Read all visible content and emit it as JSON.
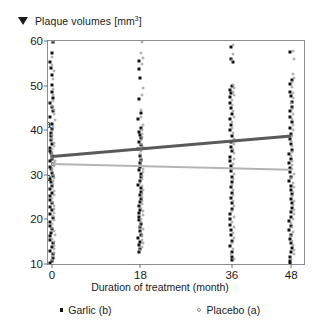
{
  "chart_data": {
    "type": "scatter",
    "title": "Plaque volumes [mm",
    "title_sup": "3",
    "title_suffix": "]",
    "xlabel": "Duration of treatment (month)",
    "ylabel": "Plaque volumes [mm3]",
    "xlim": [
      0,
      48
    ],
    "ylim": [
      10,
      60
    ],
    "grid": false,
    "xticks": [
      0,
      18,
      36,
      48
    ],
    "xtick_labels": [
      "0",
      "18",
      "36",
      "48"
    ],
    "xtick_positions_frac": [
      0.0155,
      0.361,
      0.718,
      0.95
    ],
    "yticks": [
      10,
      20,
      30,
      40,
      50,
      60
    ],
    "ytick_labels": [
      "10",
      "20",
      "30",
      "40",
      "50",
      "60"
    ],
    "legend_position": "below-axis",
    "series": [
      {
        "name": "Garlic (b)",
        "marker": "filled-square",
        "color": "#111111",
        "x_categories": [
          0,
          18,
          36,
          48
        ],
        "values_at_0": [
          59.8,
          57.2,
          55.4,
          54.0,
          52.3,
          50.1,
          48.6,
          47.2,
          46.0,
          45.1,
          44.2,
          43.0,
          41.4,
          40.2,
          39.3,
          38.6,
          37.8,
          36.9,
          36.1,
          35.4,
          34.8,
          34.2,
          33.6,
          33.0,
          32.4,
          31.8,
          31.2,
          30.5,
          29.8,
          29.1,
          28.4,
          27.6,
          26.8,
          26.0,
          25.2,
          24.4,
          23.6,
          22.8,
          22.0,
          21.2,
          20.4,
          19.5,
          18.6,
          17.8,
          17.0,
          16.2,
          15.4,
          14.6,
          13.8,
          13.0,
          12.2,
          11.4,
          10.6,
          10.2
        ],
        "values_at_18": [
          55.6,
          53.8,
          51.6,
          47.0,
          43.9,
          42.4,
          40.6,
          39.6,
          38.9,
          38.2,
          37.4,
          36.6,
          35.8,
          34.2,
          33.4,
          32.6,
          31.8,
          31.0,
          30.2,
          29.4,
          28.6,
          27.8,
          27.0,
          26.2,
          25.4,
          24.6,
          23.8,
          23.0,
          22.2,
          21.4,
          20.6,
          19.8,
          19.0,
          18.2,
          17.4,
          16.6,
          15.8,
          15.0,
          14.2,
          13.4,
          12.8
        ],
        "values_at_36": [
          58.6,
          56.0,
          55.3,
          49.8,
          49.0,
          48.3,
          47.4,
          46.2,
          45.0,
          43.6,
          42.4,
          41.2,
          40.0,
          38.6,
          37.4,
          36.2,
          35.3,
          34.0,
          33.0,
          31.9,
          30.8,
          29.6,
          28.4,
          27.2,
          26.0,
          24.8,
          23.6,
          22.4,
          21.2,
          20.0,
          18.8,
          17.6,
          16.4,
          15.2,
          14.0,
          12.8,
          11.6,
          10.8
        ],
        "values_at_48": [
          57.6,
          51.2,
          50.4,
          48.6,
          47.6,
          46.4,
          45.2,
          44.2,
          43.0,
          41.8,
          40.4,
          39.2,
          38.0,
          36.8,
          35.6,
          34.6,
          33.6,
          32.6,
          31.6,
          30.6,
          29.6,
          28.6,
          27.6,
          26.6,
          25.6,
          24.6,
          23.6,
          22.6,
          21.6,
          20.6,
          19.6,
          18.6,
          17.6,
          16.6,
          15.6,
          14.6,
          13.6,
          12.6,
          11.6,
          10.6,
          10.2
        ]
      },
      {
        "name": "Placebo (a)",
        "marker": "open-circle",
        "color": "#9a9a9a",
        "x_categories": [
          0,
          18,
          36,
          48
        ],
        "values_at_0": [
          60.0,
          56.4,
          54.6,
          53.2,
          51.4,
          49.3,
          47.8,
          46.5,
          45.5,
          44.6,
          43.6,
          42.2,
          40.8,
          39.8,
          38.9,
          38.0,
          37.2,
          36.4,
          35.7,
          35.0,
          34.4,
          33.8,
          33.2,
          32.6,
          32.0,
          31.4,
          30.8,
          30.0,
          29.3,
          28.6,
          27.9,
          27.1,
          26.3,
          25.5,
          24.7,
          23.9,
          23.1,
          22.3,
          21.5,
          20.7,
          19.9,
          19.0,
          18.1,
          17.3,
          16.5,
          15.7,
          14.9,
          14.1,
          13.3,
          12.5,
          11.7,
          10.9
        ],
        "values_at_18": [
          59.8,
          57.4,
          56.2,
          54.8,
          49.4,
          47.8,
          44.6,
          43.0,
          41.2,
          40.1,
          39.2,
          38.5,
          37.8,
          37.0,
          36.2,
          35.4,
          34.6,
          33.8,
          33.0,
          32.2,
          31.4,
          30.6,
          29.8,
          29.0,
          28.2,
          27.4,
          26.6,
          25.8,
          25.0,
          24.2,
          23.4,
          22.6,
          21.8,
          21.0,
          20.2,
          19.4,
          18.6,
          17.8,
          17.0,
          16.2,
          15.4,
          14.6,
          13.8,
          13.2
        ],
        "values_at_36": [
          59.2,
          57.0,
          55.8,
          50.2,
          49.4,
          48.6,
          47.8,
          46.8,
          45.6,
          44.4,
          43.0,
          41.8,
          40.6,
          39.4,
          38.0,
          36.8,
          35.8,
          34.8,
          33.6,
          32.4,
          31.2,
          30.2,
          29.0,
          27.8,
          26.6,
          25.4,
          24.2,
          23.0,
          21.8,
          20.6,
          19.4,
          18.2,
          17.0,
          15.8,
          14.6,
          13.4,
          12.2,
          11.2
        ],
        "values_at_48": [
          57.8,
          56.0,
          52.6,
          51.8,
          50.8,
          49.6,
          48.4,
          47.2,
          46.0,
          44.8,
          43.6,
          42.4,
          41.2,
          40.0,
          38.8,
          37.6,
          36.4,
          35.2,
          34.2,
          33.2,
          32.2,
          31.2,
          30.2,
          29.2,
          28.2,
          27.2,
          26.2,
          25.2,
          24.2,
          23.2,
          22.2,
          21.2,
          20.2,
          19.2,
          18.2,
          17.2,
          16.2,
          15.2,
          14.2,
          13.2,
          12.2,
          11.2
        ]
      }
    ],
    "trend_lines": [
      {
        "label": "a",
        "series": "Placebo (a)",
        "color": "#5a5a5a",
        "x_start": 0,
        "y_start": 34.5,
        "x_end": 48,
        "y_end": 39.1,
        "label_x": 41,
        "label_y": 41.5
      },
      {
        "label": "b",
        "series": "Garlic (b)",
        "color": "#b4b4b4",
        "x_start": 0,
        "y_start": 32.6,
        "x_end": 48,
        "y_end": 31.3,
        "label_x": 41,
        "label_y": 29.4
      }
    ],
    "legend": [
      {
        "label": "Garlic (b)",
        "marker": "filled-square"
      },
      {
        "label": "Placebo (a)",
        "marker": "open-circle"
      }
    ]
  }
}
